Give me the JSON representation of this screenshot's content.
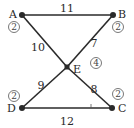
{
  "graph": {
    "nodes": [
      {
        "id": "A",
        "label": "A",
        "weight": "2",
        "x": 22,
        "y": 15,
        "lx": 9,
        "ly": 18,
        "wx": 14,
        "wy": 27
      },
      {
        "id": "B",
        "label": "B",
        "weight": "2",
        "x": 113,
        "y": 15,
        "lx": 118,
        "ly": 18,
        "wx": 118,
        "wy": 27
      },
      {
        "id": "E",
        "label": "E",
        "weight": "4",
        "x": 67,
        "y": 67,
        "lx": 73,
        "ly": 73,
        "wx": 96,
        "wy": 63
      },
      {
        "id": "D",
        "label": "D",
        "weight": "2",
        "x": 22,
        "y": 108,
        "lx": 7,
        "ly": 112,
        "wx": 14,
        "wy": 96
      },
      {
        "id": "C",
        "label": "C",
        "weight": "2",
        "x": 112,
        "y": 108,
        "lx": 118,
        "ly": 112,
        "wx": 118,
        "wy": 94
      }
    ],
    "edges": [
      {
        "from": "A",
        "to": "B",
        "weight": "11",
        "tx": 67,
        "ty": 12
      },
      {
        "from": "A",
        "to": "E",
        "weight": "10",
        "tx": 38,
        "ty": 51
      },
      {
        "from": "B",
        "to": "E",
        "weight": "7",
        "tx": 94,
        "ty": 47
      },
      {
        "from": "D",
        "to": "E",
        "weight": "9",
        "tx": 41,
        "ty": 89
      },
      {
        "from": "C",
        "to": "E",
        "weight": "8",
        "tx": 94,
        "ty": 93
      },
      {
        "from": "D",
        "to": "C",
        "weight": "12",
        "tx": 67,
        "ty": 125
      }
    ],
    "tick_mark": {
      "x": 91,
      "y": 108
    }
  }
}
